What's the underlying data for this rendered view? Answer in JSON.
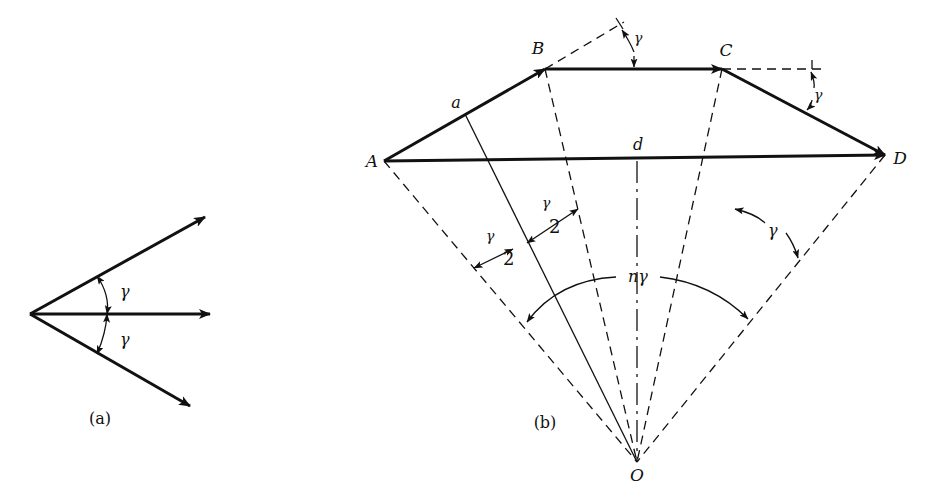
{
  "figure_a": {
    "caption": "(a)",
    "angle_upper": "γ",
    "angle_lower": "γ"
  },
  "figure_b": {
    "caption": "(b)",
    "points": {
      "A": "A",
      "B": "B",
      "C": "C",
      "D": "D",
      "O": "O"
    },
    "segment_labels": {
      "a": "a",
      "d": "d"
    },
    "angle_B": "γ",
    "angle_C": "γ",
    "half_angle_num": "γ",
    "half_angle_den": "2",
    "angle_right": "γ",
    "total_angle": "nγ"
  }
}
